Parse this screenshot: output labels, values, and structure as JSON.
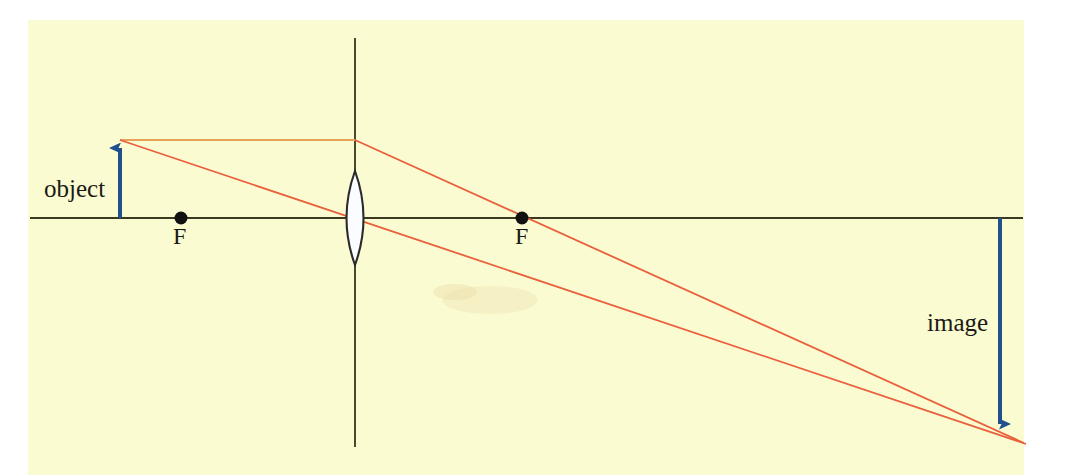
{
  "canvas": {
    "width": 1069,
    "height": 475
  },
  "colors": {
    "background": "#ffffff",
    "paper": "#fbfbd2",
    "axis": "#3a3a22",
    "ray": "#e8603c",
    "ray_light": "#e8a25a",
    "arrow": "#22508c",
    "lens_fill": "#fdfdff",
    "lens_stroke": "#2a2a2a",
    "text": "#1a1a14"
  },
  "labels": {
    "object": "object",
    "image": "image",
    "focal_left": "F",
    "focal_right": "F"
  },
  "optics": {
    "optical_axis": {
      "y": 218,
      "x_start": 30,
      "x_end": 1023
    },
    "lens_axis": {
      "x": 355,
      "y_top": 38,
      "y_bottom": 447
    },
    "lens": {
      "center_x": 355,
      "center_y": 218,
      "half_width": 16,
      "half_height": 47
    },
    "focal_point_left": {
      "x": 181,
      "y": 218,
      "radius": 6
    },
    "focal_point_right": {
      "x": 522,
      "y": 218,
      "radius": 6
    },
    "object_arrow": {
      "x": 120,
      "base_y": 218,
      "tip_y": 140
    },
    "image_arrow": {
      "x": 1000,
      "base_y": 218,
      "tip_y": 435
    },
    "rays": [
      {
        "name": "parallel-ray",
        "points": "120,140 355,140 1000,435 1022,445"
      },
      {
        "name": "center-ray",
        "points": "120,140 355,218 1000,435 1025,444"
      }
    ]
  }
}
